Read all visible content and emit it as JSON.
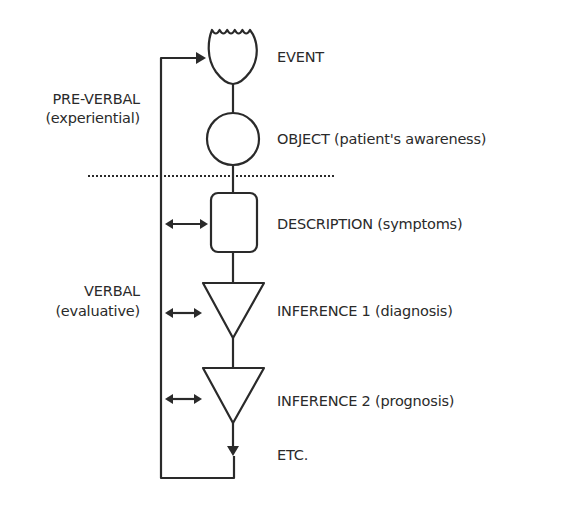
{
  "diagram": {
    "colors": {
      "stroke": "#2a2a2a",
      "background": "#ffffff"
    },
    "sections": {
      "pre_verbal": {
        "title": "PRE-VERBAL",
        "subtitle": "(experiential)"
      },
      "verbal": {
        "title": "VERBAL",
        "subtitle": "(evaluative)"
      }
    },
    "nodes": [
      {
        "id": "event",
        "shape": "tulip",
        "label": "EVENT"
      },
      {
        "id": "object",
        "shape": "circle",
        "label": "OBJECT (patient's awareness)"
      },
      {
        "id": "description",
        "shape": "rounded-rect",
        "label": "DESCRIPTION (symptoms)"
      },
      {
        "id": "inference1",
        "shape": "triangle-down",
        "label": "INFERENCE 1 (diagnosis)"
      },
      {
        "id": "inference2",
        "shape": "triangle-down",
        "label": "INFERENCE 2 (prognosis)"
      },
      {
        "id": "etc",
        "shape": "arrow-down",
        "label": "ETC."
      }
    ],
    "divider": {
      "style": "dotted",
      "separates": [
        "pre_verbal",
        "verbal"
      ]
    },
    "feedback_loop": {
      "from": "etc",
      "to": "event"
    },
    "bidirectional_arrows": [
      "description",
      "inference1",
      "inference2"
    ]
  }
}
